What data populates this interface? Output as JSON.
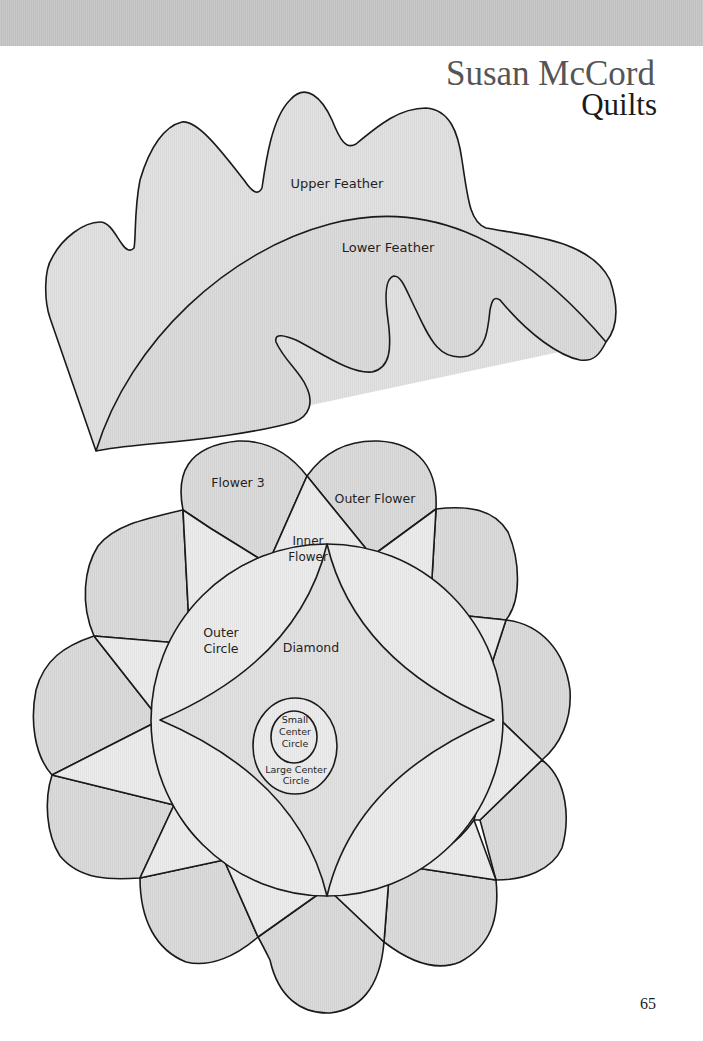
{
  "header": {
    "brand_name": "Susan McCord",
    "brand_sub": "Quilts"
  },
  "colors": {
    "band": "#c4c4c4",
    "piece_dark": "#d6d6d6",
    "piece_mid": "#dedede",
    "piece_light": "#ececec",
    "outline": "#1a1a1a",
    "background": "#ffffff"
  },
  "feather_template": {
    "labels": {
      "upper": "Upper Feather",
      "lower": "Lower Feather"
    }
  },
  "flower_template": {
    "labels": {
      "flower3": "Flower 3",
      "outer_flower": "Outer Flower",
      "inner_flower_line1": "Inner",
      "inner_flower_line2": "Flower",
      "outer_circle_line1": "Outer",
      "outer_circle_line2": "Circle",
      "diamond": "Diamond",
      "small_center_line1": "Small",
      "small_center_line2": "Center",
      "small_center_line3": "Circle",
      "large_center_line1": "Large Center",
      "large_center_line2": "Circle"
    }
  },
  "footer": {
    "page_number": "65"
  }
}
